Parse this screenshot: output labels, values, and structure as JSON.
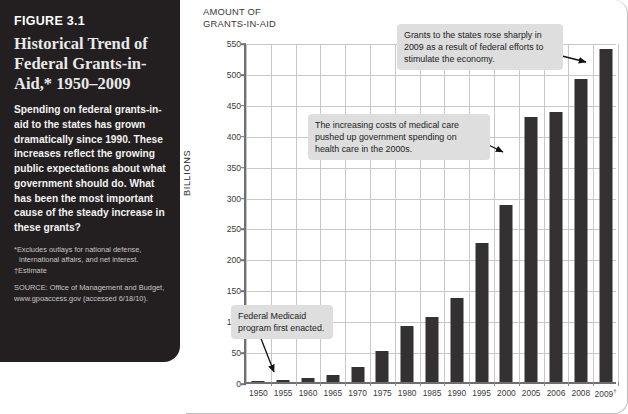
{
  "figure": {
    "label": "FIGURE 3.1",
    "title": "Historical Trend of Federal Grants-in-Aid,* 1950–2009",
    "description": "Spending on federal grants-in-aid to the states has grown dramatically since 1990. These increases reflect the growing public expectations about what government should do. What has been the most important cause of the steady increase in these grants?",
    "footnote_star": "*Excludes outlays for national defense,",
    "footnote_star_cont": "international affairs, and net interest.",
    "footnote_dagger": "†Estimate",
    "source": "SOURCE: Office of Management and Budget, www.gpoaccess.gov (accessed 6/18/10)."
  },
  "chart_data": {
    "type": "bar",
    "title": "AMOUNT OF\nGRANTS-IN-AID",
    "xlabel": "",
    "ylabel": "BILLIONS",
    "ylim": [
      0,
      550
    ],
    "yticks": [
      0,
      50,
      100,
      150,
      200,
      250,
      300,
      350,
      400,
      450,
      500,
      550
    ],
    "grid": true,
    "legend": "none",
    "bar_color": "#333132",
    "categories": [
      "1950",
      "1955",
      "1960",
      "1965",
      "1970",
      "1975",
      "1980",
      "1985",
      "1990",
      "1995",
      "2000",
      "2005",
      "2006",
      "2008",
      "2009†"
    ],
    "values": [
      2.3,
      3.2,
      7.0,
      10.9,
      24.1,
      49.8,
      91.4,
      105.9,
      135.3,
      225.0,
      285.9,
      428.0,
      436.5,
      490.0,
      538.0
    ],
    "annotations": [
      {
        "id": "callout-2009",
        "text": "Grants to the states rose sharply in 2009 as a result of federal efforts to stimulate the economy.",
        "points_to": "2009†"
      },
      {
        "id": "callout-medical",
        "text": "The increasing costs of medical care pushed up government spending on health care in the 2000s.",
        "points_to": "2000"
      },
      {
        "id": "callout-medicaid",
        "text": "Federal Medicaid program first enacted.",
        "points_to": "1965"
      }
    ]
  }
}
